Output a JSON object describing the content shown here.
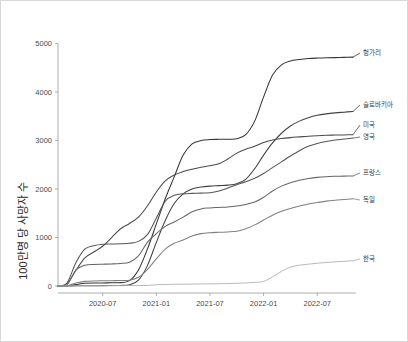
{
  "figure": {
    "background": "#ffffff",
    "border_color": "#d8d8d8"
  },
  "chart_data": {
    "type": "line",
    "title": "",
    "subtitle": "",
    "xlabel": "",
    "ylabel": "100만명 당 사망자 수",
    "ylim": [
      0,
      5300
    ],
    "yticks": [
      0,
      1000,
      2000,
      3000,
      4000,
      5000
    ],
    "ytick_labels": [
      "0",
      "1000",
      "2000",
      "3000",
      "4000",
      "5000"
    ],
    "xlim": [
      "2020-02",
      "2022-11"
    ],
    "xticks": [
      "2020-07",
      "2021-01",
      "2021-07",
      "2022-01",
      "2022-07"
    ],
    "xtick_labels": [
      "2020-07",
      "2021-01",
      "2021-07",
      "2022-01",
      "2022-07"
    ],
    "grid": false,
    "legend": "right-end-labels",
    "x": [
      "2020-02",
      "2020-03",
      "2020-04",
      "2020-05",
      "2020-06",
      "2020-07",
      "2020-08",
      "2020-09",
      "2020-10",
      "2020-11",
      "2020-12",
      "2021-01",
      "2021-02",
      "2021-03",
      "2021-04",
      "2021-05",
      "2021-06",
      "2021-07",
      "2021-08",
      "2021-09",
      "2021-10",
      "2021-11",
      "2021-12",
      "2022-01",
      "2022-02",
      "2022-03",
      "2022-04",
      "2022-05",
      "2022-06",
      "2022-07",
      "2022-08",
      "2022-09",
      "2022-10",
      "2022-11"
    ],
    "series": [
      {
        "name": "헝가리",
        "color": "#353535",
        "end_value": 4720,
        "values": [
          0,
          2,
          30,
          55,
          62,
          64,
          66,
          70,
          110,
          330,
          760,
          1280,
          1800,
          2250,
          2700,
          2930,
          3000,
          3020,
          3025,
          3028,
          3035,
          3120,
          3400,
          3900,
          4350,
          4560,
          4640,
          4670,
          4690,
          4700,
          4705,
          4710,
          4715,
          4720
        ]
      },
      {
        "name": "슬로바키아",
        "color": "#404040",
        "end_value": 3600,
        "values": [
          0,
          0,
          5,
          6,
          7,
          8,
          9,
          12,
          25,
          120,
          420,
          900,
          1350,
          1700,
          1900,
          2000,
          2040,
          2060,
          2070,
          2080,
          2110,
          2200,
          2420,
          2700,
          2950,
          3150,
          3300,
          3400,
          3470,
          3520,
          3550,
          3570,
          3585,
          3600
        ]
      },
      {
        "name": "미국",
        "color": "#4a4a4a",
        "end_value": 3120,
        "values": [
          0,
          50,
          320,
          580,
          700,
          820,
          1000,
          1180,
          1290,
          1420,
          1650,
          1940,
          2170,
          2290,
          2360,
          2410,
          2450,
          2480,
          2520,
          2620,
          2740,
          2820,
          2880,
          2960,
          3010,
          3040,
          3060,
          3075,
          3090,
          3100,
          3108,
          3112,
          3116,
          3120
        ]
      },
      {
        "name": "영국",
        "color": "#555555",
        "end_value": 3050,
        "values": [
          0,
          60,
          480,
          760,
          830,
          860,
          865,
          870,
          880,
          920,
          1060,
          1400,
          1750,
          1870,
          1900,
          1910,
          1915,
          1925,
          1960,
          2020,
          2090,
          2150,
          2220,
          2320,
          2440,
          2560,
          2680,
          2790,
          2880,
          2940,
          2980,
          3010,
          3030,
          3050
        ]
      },
      {
        "name": "프랑스",
        "color": "#666666",
        "end_value": 2270,
        "values": [
          0,
          20,
          330,
          430,
          445,
          450,
          455,
          465,
          490,
          620,
          900,
          1080,
          1230,
          1320,
          1420,
          1530,
          1590,
          1610,
          1620,
          1630,
          1650,
          1680,
          1730,
          1830,
          1960,
          2060,
          2130,
          2180,
          2215,
          2240,
          2255,
          2262,
          2266,
          2270
        ]
      },
      {
        "name": "독일",
        "color": "#808080",
        "end_value": 1800,
        "values": [
          0,
          5,
          60,
          95,
          105,
          108,
          110,
          112,
          120,
          180,
          340,
          560,
          760,
          880,
          950,
          1030,
          1080,
          1100,
          1108,
          1115,
          1130,
          1180,
          1260,
          1360,
          1460,
          1540,
          1600,
          1650,
          1690,
          1720,
          1750,
          1770,
          1785,
          1800
        ]
      },
      {
        "name": "한국",
        "color": "#b0b0b0",
        "end_value": 520,
        "values": [
          0,
          2,
          5,
          6,
          6,
          7,
          7,
          8,
          9,
          10,
          12,
          26,
          32,
          35,
          38,
          40,
          42,
          44,
          47,
          50,
          56,
          62,
          75,
          95,
          190,
          300,
          390,
          430,
          450,
          470,
          485,
          498,
          510,
          520
        ]
      }
    ]
  },
  "labels": {
    "series_label_names": [
      "헝가리",
      "슬로바키아",
      "미국",
      "영국",
      "프랑스",
      "독일",
      "한국"
    ]
  }
}
